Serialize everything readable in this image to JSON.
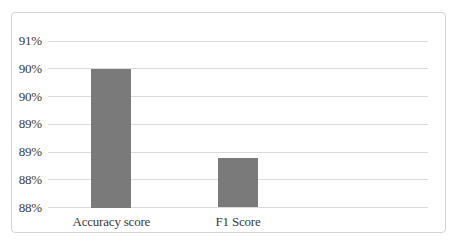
{
  "page": {
    "background_color": "#ffffff",
    "frame_border_color": "#d4d4d4"
  },
  "chart_data": {
    "type": "bar",
    "title": "",
    "categories": [
      "Accuracy score",
      "F1 Score"
    ],
    "values": [
      90.0,
      88.4
    ],
    "value_unit": "%",
    "xlabel": "",
    "ylabel": "",
    "ylim": [
      87.5,
      90.5
    ],
    "ytick_step": 0.5,
    "ytick_labels_top_to_bottom": [
      "91%",
      "90%",
      "90%",
      "89%",
      "89%",
      "88%",
      "88%"
    ],
    "grid": true,
    "legend": false,
    "data_labels": false,
    "category_slots": 3,
    "bar_color": "#7a7a7a",
    "gridline_color": "#dadada",
    "text_color": "#3a3a3a"
  }
}
